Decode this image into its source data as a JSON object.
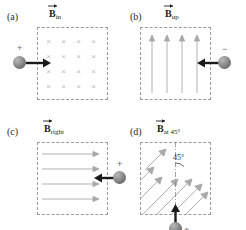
{
  "figure": {
    "colors": {
      "box_border": "#9a9a9a",
      "field_arrow": "#a8a8a8",
      "x_mark": "#b9b9b9",
      "velocity_arrow": "#1a1a1a",
      "charge_fill": "#8f8f8f",
      "text": "#1c1c1c"
    },
    "panels": [
      {
        "tag": "(a)",
        "field_symbol": "B",
        "field_subscript": "in",
        "field_type": "into-page",
        "field_marker": "×",
        "marker_rows": 4,
        "marker_cols": 4,
        "charge_sign": "+",
        "charge_position": "left-outside",
        "velocity_direction": "right"
      },
      {
        "tag": "(b)",
        "field_symbol": "B",
        "field_subscript": "up",
        "field_type": "up",
        "arrow_count": 4,
        "charge_sign": "−",
        "charge_position": "right-outside",
        "velocity_direction": "left"
      },
      {
        "tag": "(c)",
        "field_symbol": "B",
        "field_subscript": "right",
        "field_type": "right",
        "arrow_count": 4,
        "charge_sign": "+",
        "charge_position": "right-outside",
        "velocity_direction": "left"
      },
      {
        "tag": "(d)",
        "field_symbol": "B",
        "field_subscript": "at 45°",
        "field_type": "diagonal-45",
        "arrow_count": 7,
        "angle_label": "45°",
        "charge_sign": "+",
        "charge_position": "bottom-outside",
        "velocity_direction": "up"
      }
    ]
  }
}
